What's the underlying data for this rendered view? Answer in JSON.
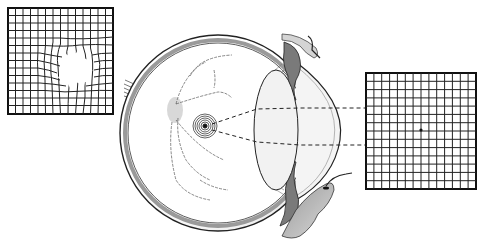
{
  "diagram": {
    "panels": [
      {
        "id": "distorted-grid",
        "description": "Amsler grid with central distortion and blank spot (metamorphopsia / scotoma)",
        "rows": 14,
        "cols": 14
      },
      {
        "id": "normal-grid",
        "description": "Normal Amsler grid with central fixation dot",
        "rows": 14,
        "cols": 14
      }
    ],
    "elements": [
      "optic nerve",
      "sclera",
      "retina blood vessels",
      "optic disc",
      "macula (concentric rings)",
      "lens",
      "cornea",
      "iris / ciliary body",
      "eyelids",
      "light path (dashed lines)"
    ],
    "colors": {
      "line": "#1a1a1a",
      "shade": "#8a8a8a",
      "light_shade": "#d0d0d0",
      "background": "#ffffff"
    }
  }
}
